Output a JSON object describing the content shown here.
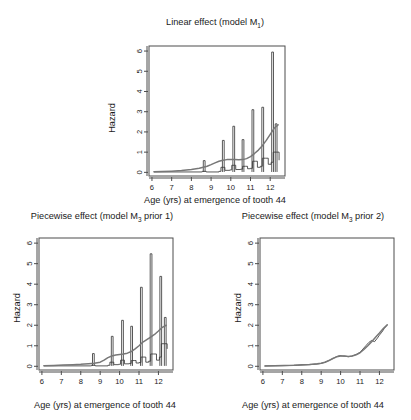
{
  "figure": {
    "caption_axis_label": "Age (yrs) at emergence of tooth 44",
    "y_axis_label": "Hazard",
    "line_color_smooth": "#777777",
    "line_color_step": "#3a3a3a",
    "background": "#ffffff"
  },
  "panels": {
    "top": {
      "title_main": "Linear effect (model M",
      "title_sub": "1",
      "title_tail": ")",
      "title_full": "Linear effect (model M1)"
    },
    "bottom_left": {
      "title_main": "Piecewise effect (model M",
      "title_sub": "3",
      "title_tail": " prior 1)",
      "title_full": "Piecewise effect (model M3 prior 1)"
    },
    "bottom_right": {
      "title_main": "Piecewise effect (model M",
      "title_sub": "3",
      "title_tail": " prior 2)",
      "title_full": "Piecewise effect (model M3 prior 2)"
    }
  },
  "chart_data": [
    {
      "id": "linear-effect-m1",
      "type": "line",
      "title": "Linear effect (model M1)",
      "xlabel": "Age (yrs) at emergence of tooth 44",
      "ylabel": "Hazard",
      "xlim": [
        5.85,
        12.75
      ],
      "ylim": [
        -0.18,
        6.25
      ],
      "xticks": [
        6,
        7,
        8,
        9,
        10,
        11,
        12
      ],
      "yticks": [
        0,
        1,
        2,
        3,
        4,
        5,
        6
      ],
      "grid": false,
      "legend": "none",
      "series": [
        {
          "name": "smooth hazard (model-based)",
          "style": "smooth-line",
          "color": "#777777",
          "x": [
            6.1,
            6.5,
            7.0,
            7.5,
            8.0,
            8.4,
            8.8,
            9.0,
            9.2,
            9.4,
            9.6,
            9.8,
            10.0,
            10.2,
            10.4,
            10.6,
            10.8,
            11.0,
            11.2,
            11.4,
            11.6,
            11.8,
            12.0,
            12.2,
            12.4
          ],
          "y": [
            0.03,
            0.04,
            0.06,
            0.09,
            0.14,
            0.2,
            0.3,
            0.38,
            0.47,
            0.55,
            0.6,
            0.63,
            0.64,
            0.63,
            0.62,
            0.63,
            0.68,
            0.78,
            0.93,
            1.1,
            1.32,
            1.58,
            1.88,
            2.18,
            2.35
          ]
        },
        {
          "name": "empirical step hazard",
          "style": "step-with-spikes",
          "color": "#3a3a3a",
          "baseline_x": [
            6.1,
            8.5,
            8.55,
            8.7,
            8.75,
            9.4,
            9.5,
            9.65,
            9.7,
            9.95,
            10.05,
            10.2,
            10.25,
            10.5,
            10.6,
            10.75,
            10.85,
            11.0,
            11.1,
            11.25,
            11.35,
            11.5,
            11.6,
            11.75,
            11.9,
            12.05,
            12.15,
            12.3,
            12.45
          ],
          "baseline_y": [
            0.02,
            0.02,
            0.05,
            0.05,
            0.02,
            0.05,
            0.25,
            0.25,
            0.1,
            0.12,
            0.35,
            0.35,
            0.14,
            0.16,
            0.3,
            0.3,
            0.18,
            0.2,
            0.55,
            0.55,
            0.25,
            0.3,
            0.7,
            0.7,
            0.4,
            0.5,
            1.0,
            1.0,
            0.6
          ],
          "spikes": [
            {
              "x": 8.65,
              "height": 0.58
            },
            {
              "x": 9.62,
              "height": 1.58
            },
            {
              "x": 10.15,
              "height": 2.28
            },
            {
              "x": 10.62,
              "height": 1.62
            },
            {
              "x": 11.12,
              "height": 3.1
            },
            {
              "x": 11.62,
              "height": 3.22
            },
            {
              "x": 12.12,
              "height": 5.95
            },
            {
              "x": 12.3,
              "height": 2.4
            }
          ]
        }
      ]
    },
    {
      "id": "piecewise-m3-prior1",
      "type": "line",
      "title": "Piecewise effect (model M3 prior 1)",
      "xlabel": "Age (yrs) at emergence of tooth 44",
      "ylabel": "Hazard",
      "xlim": [
        5.85,
        12.75
      ],
      "ylim": [
        -0.18,
        6.25
      ],
      "xticks": [
        6,
        7,
        8,
        9,
        10,
        11,
        12
      ],
      "yticks": [
        0,
        1,
        2,
        3,
        4,
        5,
        6
      ],
      "grid": false,
      "legend": "none",
      "series": [
        {
          "name": "smooth hazard (model-based)",
          "style": "smooth-line",
          "color": "#777777",
          "x": [
            6.1,
            6.6,
            7.1,
            7.6,
            8.0,
            8.4,
            8.7,
            9.0,
            9.2,
            9.4,
            9.6,
            9.8,
            10.0,
            10.2,
            10.4,
            10.6,
            10.8,
            11.0,
            11.2,
            11.4,
            11.6,
            11.8,
            12.0,
            12.2,
            12.4
          ],
          "y": [
            0.03,
            0.04,
            0.06,
            0.08,
            0.1,
            0.13,
            0.15,
            0.2,
            0.3,
            0.42,
            0.5,
            0.55,
            0.58,
            0.6,
            0.64,
            0.72,
            0.85,
            1.0,
            1.18,
            1.3,
            1.42,
            1.55,
            1.72,
            1.9,
            2.0
          ]
        },
        {
          "name": "empirical step hazard",
          "style": "step-with-spikes",
          "color": "#3a3a3a",
          "baseline_x": [
            6.1,
            8.5,
            8.55,
            8.7,
            8.75,
            9.4,
            9.5,
            9.65,
            9.7,
            9.95,
            10.05,
            10.2,
            10.25,
            10.5,
            10.6,
            10.75,
            10.85,
            11.0,
            11.1,
            11.25,
            11.35,
            11.5,
            11.6,
            11.75,
            11.9,
            12.05,
            12.15,
            12.3,
            12.45
          ],
          "baseline_y": [
            0.02,
            0.02,
            0.05,
            0.05,
            0.02,
            0.05,
            0.2,
            0.2,
            0.08,
            0.1,
            0.3,
            0.3,
            0.12,
            0.14,
            0.28,
            0.28,
            0.16,
            0.18,
            0.45,
            0.45,
            0.2,
            0.25,
            0.6,
            0.6,
            0.3,
            0.45,
            1.1,
            1.1,
            0.85
          ],
          "spikes": [
            {
              "x": 8.65,
              "height": 0.62
            },
            {
              "x": 9.62,
              "height": 1.46
            },
            {
              "x": 10.15,
              "height": 2.24
            },
            {
              "x": 10.62,
              "height": 1.95
            },
            {
              "x": 11.12,
              "height": 3.85
            },
            {
              "x": 11.62,
              "height": 5.48
            },
            {
              "x": 12.12,
              "height": 4.38
            },
            {
              "x": 12.35,
              "height": 2.38
            }
          ]
        }
      ]
    },
    {
      "id": "piecewise-m3-prior2",
      "type": "line",
      "title": "Piecewise effect (model M3 prior 2)",
      "xlabel": "Age (yrs) at emergence of tooth 44",
      "ylabel": "Hazard",
      "xlim": [
        5.85,
        12.75
      ],
      "ylim": [
        -0.18,
        6.25
      ],
      "xticks": [
        6,
        7,
        8,
        9,
        10,
        11,
        12
      ],
      "yticks": [
        0,
        1,
        2,
        3,
        4,
        5,
        6
      ],
      "grid": false,
      "legend": "none",
      "series": [
        {
          "name": "smooth hazard (model-based)",
          "style": "smooth-line",
          "color": "#777777",
          "x": [
            6.1,
            6.6,
            7.1,
            7.6,
            8.0,
            8.4,
            8.8,
            9.0,
            9.2,
            9.4,
            9.6,
            9.8,
            10.0,
            10.2,
            10.4,
            10.6,
            10.8,
            11.0,
            11.2,
            11.4,
            11.6,
            11.8,
            12.0,
            12.2,
            12.4
          ],
          "y": [
            0.02,
            0.03,
            0.04,
            0.05,
            0.07,
            0.09,
            0.12,
            0.15,
            0.2,
            0.28,
            0.38,
            0.46,
            0.5,
            0.5,
            0.48,
            0.5,
            0.56,
            0.66,
            0.82,
            1.0,
            1.2,
            1.42,
            1.62,
            1.84,
            2.02
          ]
        },
        {
          "name": "empirical step hazard",
          "style": "jagged-line",
          "color": "#3a3a3a",
          "x": [
            6.1,
            7.0,
            7.8,
            8.4,
            8.8,
            9.0,
            9.2,
            9.35,
            9.5,
            9.65,
            9.8,
            9.95,
            10.1,
            10.25,
            10.4,
            10.55,
            10.7,
            10.85,
            11.0,
            11.15,
            11.3,
            11.45,
            11.6,
            11.75,
            11.9,
            12.0,
            12.12,
            12.25,
            12.4
          ],
          "y": [
            0.02,
            0.03,
            0.05,
            0.08,
            0.11,
            0.14,
            0.2,
            0.26,
            0.33,
            0.4,
            0.48,
            0.52,
            0.5,
            0.49,
            0.47,
            0.49,
            0.54,
            0.6,
            0.68,
            0.84,
            1.0,
            1.16,
            1.26,
            1.2,
            1.38,
            1.52,
            1.66,
            1.84,
            2.02
          ]
        }
      ]
    }
  ]
}
